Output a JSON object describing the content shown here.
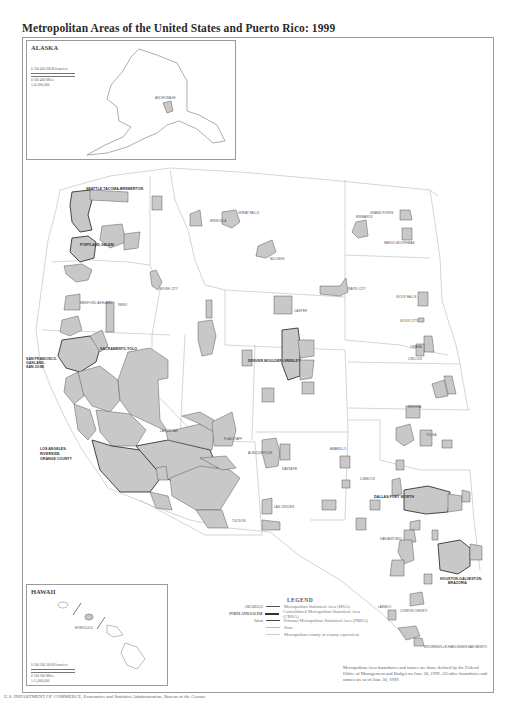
{
  "title": "Metropolitan Areas of the United States and Puerto Rico: 1999",
  "insets": {
    "alaska": {
      "label": "ALASKA",
      "scale_km": "0    100    400    600 Kilometers",
      "scale_mi": "0         300         400 Miles",
      "ratio": "1:45,000,000",
      "cities": [
        "ANCHORAGE"
      ]
    },
    "hawaii": {
      "label": "HAWAII",
      "scale_km": "0    100    200    300 Kilometers",
      "scale_mi": "0         100         200 Miles",
      "ratio": "1:15,000,000",
      "cities": [
        "HONOLULU"
      ]
    }
  },
  "map": {
    "fill_color": "#c8c8c8",
    "msa_border_color": "#555555",
    "cmsa_border_color": "#333333",
    "state_line_color": "#b5b5b5",
    "labels_bold": [
      "SEATTLE-TACOMA-BREMERTON",
      "PORTLAND-SALEM",
      "SAN FRANCISCO-OAKLAND-SAN JOSE",
      "SACRAMENTO-YOLO",
      "LOS ANGELES-RIVERSIDE-ORANGE COUNTY",
      "DENVER-BOULDER-GREELEY",
      "DALLAS-FORT WORTH",
      "HOUSTON-GALVESTON-BRAZORIA"
    ],
    "labels": [
      "Bellingham",
      "Seattle",
      "Bellevue",
      "Everett",
      "Tacoma",
      "Olympia",
      "Bremerton",
      "Yakima",
      "Richland-Kennewick-Pasco",
      "Spokane",
      "Portland-Vancouver",
      "Salem",
      "Eugene-Springfield",
      "Corvallis",
      "Medford-Ashland",
      "Redding",
      "Chico-Paradise",
      "Reno",
      "Boise City",
      "Pocatello",
      "Missoula",
      "Great Falls",
      "Billings",
      "Casper",
      "Rapid City",
      "Grand Forks",
      "Fargo-Moorhead",
      "Bismarck",
      "Sioux Falls",
      "Sioux City",
      "Omaha",
      "Lincoln",
      "Salt Lake City-Ogden",
      "Provo-Orem",
      "Grand Junction",
      "Fort Collins-Loveland",
      "Colorado Springs",
      "Pueblo",
      "Las Vegas",
      "Flagstaff",
      "Phoenix-Mesa",
      "Tucson",
      "Yuma",
      "Albuquerque",
      "Santa Fe",
      "Las Cruces",
      "El Paso",
      "Amarillo",
      "Lubbock",
      "Odessa-Midland",
      "San Angelo",
      "Abilene",
      "Wichita Falls",
      "Lawton",
      "Oklahoma City",
      "Tulsa",
      "Wichita",
      "Topeka",
      "Lawrence",
      "Kansas City",
      "Joplin",
      "Fort Smith",
      "Texarkana",
      "Longview-Marshall",
      "Tyler",
      "Waco",
      "Killeen-Temple",
      "Bryan-College Station",
      "Austin-San Marcos",
      "San Antonio",
      "Victoria",
      "Corpus Christi",
      "Laredo",
      "Beaumont-Port Arthur",
      "McAllen-Edinburg-Mission",
      "Brownsville-Harlingen-San Benito",
      "Fresno",
      "Modesto",
      "Stockton-Lodi",
      "Merced",
      "Visalia-Tulare-Porterville",
      "Bakersfield",
      "Salinas",
      "Santa Barbara-Santa Maria-Lompoc",
      "San Luis Obispo",
      "San Diego",
      "Yuba City",
      "Santa Rosa",
      "Napa",
      "Vallejo-Fairfield",
      "Santa Cruz",
      "Fort Worth-Arlington",
      "Dallas",
      "Galveston-Texas City",
      "Brazoria",
      "Sherman-Denison"
    ]
  },
  "legend": {
    "title": "LEGEND",
    "items": [
      {
        "key": "AMARILLO",
        "label": "Metropolitan Statistical Area (MSA)",
        "style": "msa"
      },
      {
        "key": "PORTLAND-SALEM",
        "label": "Consolidated Metropolitan Statistical Area (CMSA)",
        "style": "cmsa"
      },
      {
        "key": "Salem",
        "label": "Primary Metropolitan Statistical Area (PMSA)",
        "style": "pmsa"
      },
      {
        "key": "",
        "label": "State",
        "style": "state"
      },
      {
        "key": "",
        "label": "Metropolitan county or county equivalent",
        "style": "county"
      }
    ]
  },
  "note": "Metropolitan Area boundaries and names are those defined by the Federal Office of Management and Budget on June 30, 1999. All other boundaries and names are as of June 30, 1999.",
  "footer": "U.S. DEPARTMENT OF COMMERCE, Economics and Statistics Administration, Bureau of the Census"
}
